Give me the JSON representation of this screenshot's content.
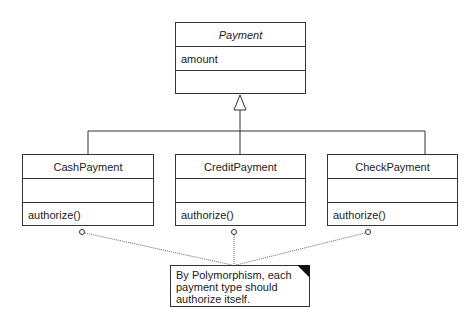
{
  "diagram": {
    "type": "UML class diagram",
    "superclass": {
      "name": "Payment",
      "abstract": true,
      "attributes": [
        "amount"
      ],
      "operations": []
    },
    "subclasses": [
      {
        "name": "CashPayment",
        "attributes": [],
        "operations": [
          "authorize()"
        ]
      },
      {
        "name": "CreditPayment",
        "attributes": [],
        "operations": [
          "authorize()"
        ]
      },
      {
        "name": "CheckPayment",
        "attributes": [],
        "operations": [
          "authorize()"
        ]
      }
    ],
    "note": {
      "lines": [
        "By Polymorphism, each",
        "payment type should",
        "authorize itself."
      ]
    },
    "relationships": [
      {
        "type": "generalization",
        "from": "CashPayment",
        "to": "Payment"
      },
      {
        "type": "generalization",
        "from": "CreditPayment",
        "to": "Payment"
      },
      {
        "type": "generalization",
        "from": "CheckPayment",
        "to": "Payment"
      },
      {
        "type": "note-anchor",
        "from": "note",
        "to": "CashPayment.authorize()"
      },
      {
        "type": "note-anchor",
        "from": "note",
        "to": "CreditPayment.authorize()"
      },
      {
        "type": "note-anchor",
        "from": "note",
        "to": "CheckPayment.authorize()"
      }
    ]
  }
}
